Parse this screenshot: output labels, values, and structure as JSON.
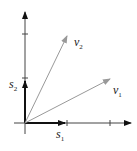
{
  "diagram": {
    "type": "vector-basis-diagram",
    "axes": {
      "color": "#333333",
      "x_ticks": 2,
      "y_ticks": 2
    },
    "vectors": [
      {
        "name": "s1",
        "label": "s",
        "sub": "1",
        "color": "#111111"
      },
      {
        "name": "s2",
        "label": "s",
        "sub": "2",
        "color": "#111111"
      },
      {
        "name": "v1",
        "label": "v",
        "sub": "1",
        "color": "#999999"
      },
      {
        "name": "v2",
        "label": "v",
        "sub": "2",
        "color": "#999999"
      }
    ]
  }
}
